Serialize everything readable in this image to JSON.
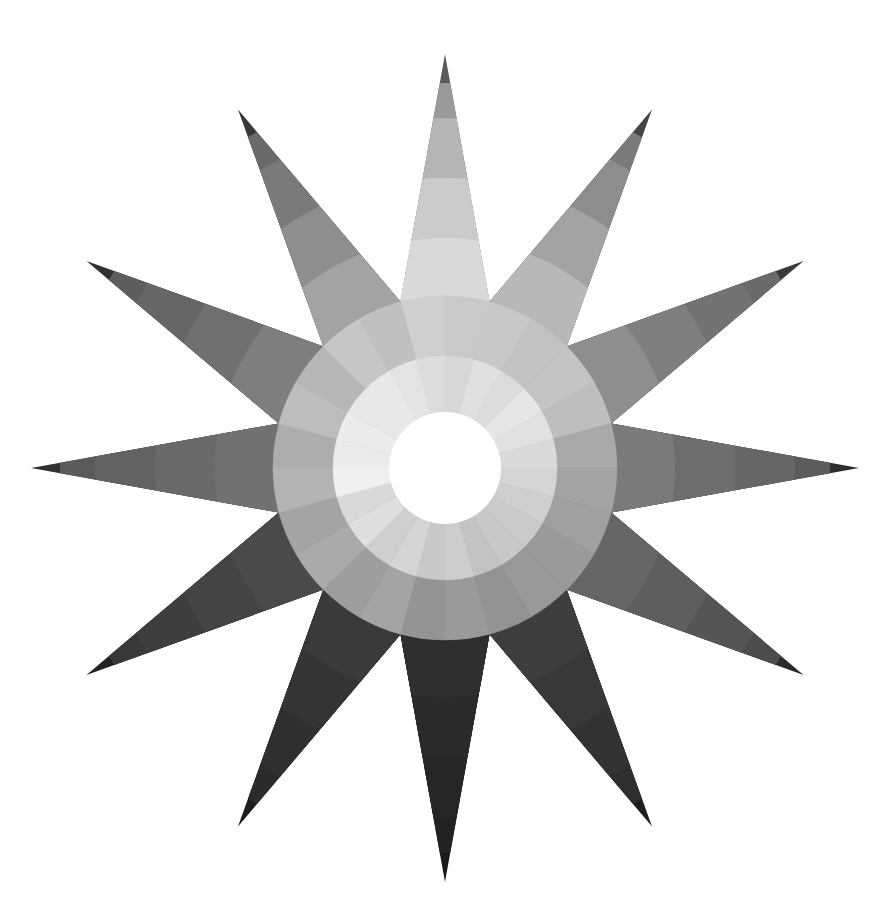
{
  "figure": {
    "title": "",
    "background": "#ffffff",
    "center": [
      445,
      468
    ],
    "tip_radius": 414,
    "valley_radius": 172,
    "spike_count": 12,
    "rings": {
      "white_center_radius": 56,
      "inner_ring_radius": 112,
      "outer_ring_radius": 172
    },
    "spike_band_radii": [
      172,
      230,
      290,
      350,
      385,
      414
    ],
    "spikes": [
      {
        "angle": -90,
        "bands": [
          "#d9d9d9",
          "#cbcbcb",
          "#b5b5b5",
          "#9a9a9a",
          "#5a5a5a"
        ],
        "inner": "#dcdcdc",
        "outer": "#cfcfcf"
      },
      {
        "angle": -60,
        "bands": [
          "#b8b8b8",
          "#a3a3a3",
          "#8d8d8d",
          "#7a7a7a",
          "#444444"
        ],
        "inner": "#e0e0e0",
        "outer": "#c8c8c8"
      },
      {
        "angle": -30,
        "bands": [
          "#8e8e8e",
          "#7f7f7f",
          "#737373",
          "#6a6a6a",
          "#3a3a3a"
        ],
        "inner": "#e6e6e6",
        "outer": "#c4c4c4"
      },
      {
        "angle": 0,
        "bands": [
          "#7a7a7a",
          "#6e6e6e",
          "#666666",
          "#5c5c5c",
          "#2f2f2f"
        ],
        "inner": "#dadada",
        "outer": "#a9a9a9"
      },
      {
        "angle": 30,
        "bands": [
          "#666666",
          "#5e5e5e",
          "#555555",
          "#4c4c4c",
          "#2a2a2a"
        ],
        "inner": "#cfcfcf",
        "outer": "#a0a0a0"
      },
      {
        "angle": 60,
        "bands": [
          "#3e3e3e",
          "#383838",
          "#333333",
          "#2e2e2e",
          "#1e1e1e"
        ],
        "inner": "#c8c8c8",
        "outer": "#999999"
      },
      {
        "angle": 90,
        "bands": [
          "#2e2e2e",
          "#2a2a2a",
          "#262626",
          "#222222",
          "#1a1a1a"
        ],
        "inner": "#cdcdcd",
        "outer": "#9a9a9a"
      },
      {
        "angle": 120,
        "bands": [
          "#3a3a3a",
          "#343434",
          "#2f2f2f",
          "#2b2b2b",
          "#1c1c1c"
        ],
        "inner": "#d4d4d4",
        "outer": "#a4a4a4"
      },
      {
        "angle": 150,
        "bands": [
          "#4a4a4a",
          "#444444",
          "#3e3e3e",
          "#383838",
          "#222222"
        ],
        "inner": "#dedede",
        "outer": "#aaaaaa"
      },
      {
        "angle": 180,
        "bands": [
          "#717171",
          "#6a6a6a",
          "#626262",
          "#5a5a5a",
          "#303030"
        ],
        "inner": "#f0f0f0",
        "outer": "#b3b3b3"
      },
      {
        "angle": 210,
        "bands": [
          "#7e7e7e",
          "#707070",
          "#666666",
          "#5d5d5d",
          "#303030"
        ],
        "inner": "#ececec",
        "outer": "#bdbdbd"
      },
      {
        "angle": 240,
        "bands": [
          "#a3a3a3",
          "#8e8e8e",
          "#7a7a7a",
          "#6a6a6a",
          "#383838"
        ],
        "inner": "#e8e8e8",
        "outer": "#c6c6c6"
      }
    ]
  }
}
